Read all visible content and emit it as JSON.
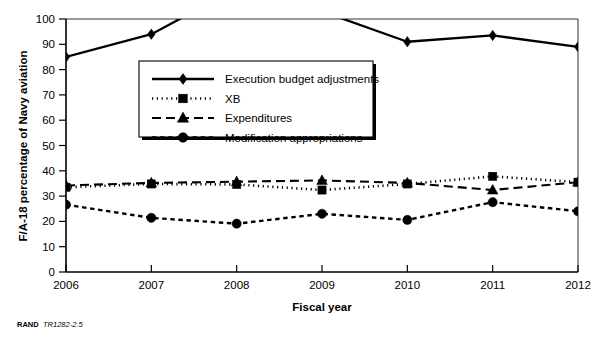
{
  "figure": {
    "source_prefix": "RAND",
    "source_id": "TR1282-2.5"
  },
  "chart_data": {
    "type": "line",
    "title": "",
    "xlabel": "Fiscal year",
    "ylabel": "F/A-18 percentage of Navy aviation",
    "x": [
      2006,
      2007,
      2008,
      2009,
      2010,
      2011,
      2012
    ],
    "xtick_labels": [
      "2006",
      "2007",
      "2008",
      "2009",
      "2010",
      "2011",
      "2012"
    ],
    "ytick_labels": [
      "0",
      "10",
      "20",
      "30",
      "40",
      "50",
      "60",
      "70",
      "80",
      "90",
      "100"
    ],
    "ytick_values": [
      0,
      10,
      20,
      30,
      40,
      50,
      60,
      70,
      80,
      90,
      100
    ],
    "xlim": [
      2006,
      2012
    ],
    "ylim": [
      0,
      100
    ],
    "grid": false,
    "legend_position": "upper-center-left",
    "note": "Execution budget adjustments exceeds the 100 percent axis maximum in 2008 and is clipped off-scale.",
    "series": [
      {
        "name": "Execution budget adjustments",
        "marker": "diamond",
        "linestyle": "solid",
        "values": [
          85,
          94,
          112,
          103,
          91,
          93.5,
          89
        ],
        "clipped": [
          false,
          false,
          true,
          true,
          false,
          false,
          false
        ]
      },
      {
        "name": "XB",
        "marker": "square",
        "linestyle": "dotted",
        "values": [
          33.5,
          34.8,
          34.6,
          32.4,
          34.8,
          37.8,
          35.5
        ],
        "clipped": [
          false,
          false,
          false,
          false,
          false,
          false,
          false
        ]
      },
      {
        "name": "Expenditures",
        "marker": "triangle",
        "linestyle": "dashed",
        "values": [
          34.2,
          35.2,
          35.7,
          36.2,
          35.2,
          32.4,
          35.5
        ],
        "clipped": [
          false,
          false,
          false,
          false,
          false,
          false,
          false
        ]
      },
      {
        "name": "Modification appropriations",
        "marker": "circle",
        "linestyle": "dashed-short",
        "values": [
          26.6,
          21.4,
          19.1,
          23,
          20.6,
          27.6,
          24
        ],
        "clipped": [
          false,
          false,
          false,
          false,
          false,
          false,
          false
        ]
      }
    ]
  }
}
